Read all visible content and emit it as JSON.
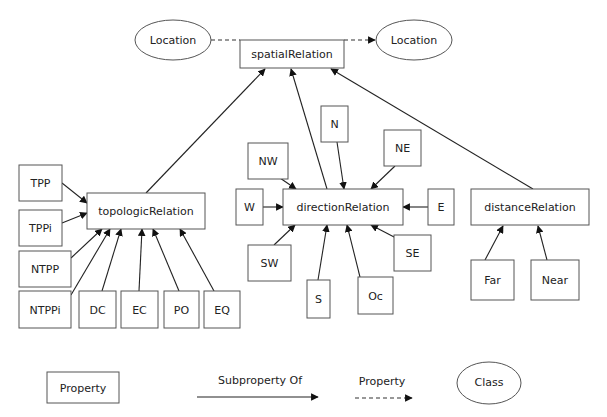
{
  "diagram": {
    "nodes": [
      {
        "id": "loc1",
        "label": "Location",
        "shape": "ellipse",
        "cx": 173,
        "cy": 40,
        "rx": 38,
        "ry": 20
      },
      {
        "id": "spatial",
        "label": "spatialRelation",
        "shape": "box",
        "x": 240,
        "y": 40,
        "w": 104,
        "h": 28
      },
      {
        "id": "loc2",
        "label": "Location",
        "shape": "ellipse",
        "cx": 414,
        "cy": 40,
        "rx": 38,
        "ry": 20
      },
      {
        "id": "topo",
        "label": "topologicRelation",
        "shape": "box",
        "x": 87,
        "y": 193,
        "w": 118,
        "h": 36
      },
      {
        "id": "TPP",
        "label": "TPP",
        "shape": "box",
        "x": 19,
        "y": 165,
        "w": 43,
        "h": 36
      },
      {
        "id": "TPPi",
        "label": "TPPi",
        "shape": "box",
        "x": 19,
        "y": 210,
        "w": 43,
        "h": 36
      },
      {
        "id": "NTPP",
        "label": "NTPP",
        "shape": "box",
        "x": 19,
        "y": 251,
        "w": 52,
        "h": 36
      },
      {
        "id": "NTPPi",
        "label": "NTPPi",
        "shape": "box",
        "x": 19,
        "y": 291,
        "w": 52,
        "h": 37
      },
      {
        "id": "DC",
        "label": "DC",
        "shape": "box",
        "x": 79,
        "y": 291,
        "w": 37,
        "h": 37
      },
      {
        "id": "EC",
        "label": "EC",
        "shape": "box",
        "x": 121,
        "y": 291,
        "w": 37,
        "h": 37
      },
      {
        "id": "PO",
        "label": "PO",
        "shape": "box",
        "x": 164,
        "y": 291,
        "w": 35,
        "h": 37
      },
      {
        "id": "EQ",
        "label": "EQ",
        "shape": "box",
        "x": 204,
        "y": 291,
        "w": 36,
        "h": 37
      },
      {
        "id": "dir",
        "label": "directionRelation",
        "shape": "box",
        "x": 283,
        "y": 189,
        "w": 120,
        "h": 36
      },
      {
        "id": "N",
        "label": "N",
        "shape": "box",
        "x": 321,
        "y": 106,
        "w": 27,
        "h": 36
      },
      {
        "id": "NE",
        "label": "NE",
        "shape": "box",
        "x": 384,
        "y": 130,
        "w": 37,
        "h": 36
      },
      {
        "id": "NW",
        "label": "NW",
        "shape": "box",
        "x": 248,
        "y": 143,
        "w": 40,
        "h": 36
      },
      {
        "id": "W",
        "label": "W",
        "shape": "box",
        "x": 236,
        "y": 189,
        "w": 27,
        "h": 36
      },
      {
        "id": "E",
        "label": "E",
        "shape": "box",
        "x": 428,
        "y": 189,
        "w": 26,
        "h": 36
      },
      {
        "id": "SW",
        "label": "SW",
        "shape": "box",
        "x": 248,
        "y": 245,
        "w": 43,
        "h": 36
      },
      {
        "id": "SE",
        "label": "SE",
        "shape": "box",
        "x": 394,
        "y": 235,
        "w": 37,
        "h": 36
      },
      {
        "id": "S",
        "label": "S",
        "shape": "box",
        "x": 307,
        "y": 280,
        "w": 23,
        "h": 38
      },
      {
        "id": "Oc",
        "label": "Oc",
        "shape": "box",
        "x": 358,
        "y": 277,
        "w": 35,
        "h": 37
      },
      {
        "id": "dist",
        "label": "distanceRelation",
        "shape": "box",
        "x": 471,
        "y": 189,
        "w": 118,
        "h": 36
      },
      {
        "id": "Far",
        "label": "Far",
        "shape": "box",
        "x": 471,
        "y": 260,
        "w": 43,
        "h": 40
      },
      {
        "id": "Near",
        "label": "Near",
        "shape": "box",
        "x": 531,
        "y": 260,
        "w": 48,
        "h": 40
      }
    ],
    "edges": [
      {
        "from": "loc1",
        "to": "spatial",
        "kind": "property",
        "x1": 211,
        "y1": 40,
        "x2": 240,
        "y2": 40,
        "arrow": false
      },
      {
        "from": "spatial",
        "to": "loc2",
        "kind": "property",
        "x1": 344,
        "y1": 40,
        "x2": 375,
        "y2": 40,
        "arrow": true
      },
      {
        "from": "topo",
        "to": "spatial",
        "kind": "subPropertyOf",
        "x1": 146,
        "y1": 193,
        "x2": 265,
        "y2": 69
      },
      {
        "from": "dir",
        "to": "spatial",
        "kind": "subPropertyOf",
        "x1": 327,
        "y1": 189,
        "x2": 291,
        "y2": 69
      },
      {
        "from": "dist",
        "to": "spatial",
        "kind": "subPropertyOf",
        "x1": 533,
        "y1": 189,
        "x2": 331,
        "y2": 69
      },
      {
        "from": "TPP",
        "to": "topo",
        "kind": "subPropertyOf",
        "x1": 62,
        "y1": 183,
        "x2": 87,
        "y2": 203
      },
      {
        "from": "TPPi",
        "to": "topo",
        "kind": "subPropertyOf",
        "x1": 62,
        "y1": 223,
        "x2": 87,
        "y2": 213
      },
      {
        "from": "NTPP",
        "to": "topo",
        "kind": "subPropertyOf",
        "x1": 71,
        "y1": 258,
        "x2": 102,
        "y2": 229
      },
      {
        "from": "NTPPi",
        "to": "topo",
        "kind": "subPropertyOf",
        "x1": 71,
        "y1": 295,
        "x2": 110,
        "y2": 229
      },
      {
        "from": "DC",
        "to": "topo",
        "kind": "subPropertyOf",
        "x1": 102,
        "y1": 291,
        "x2": 121,
        "y2": 229
      },
      {
        "from": "EC",
        "to": "topo",
        "kind": "subPropertyOf",
        "x1": 139,
        "y1": 291,
        "x2": 142,
        "y2": 229
      },
      {
        "from": "PO",
        "to": "topo",
        "kind": "subPropertyOf",
        "x1": 179,
        "y1": 291,
        "x2": 153,
        "y2": 229
      },
      {
        "from": "EQ",
        "to": "topo",
        "kind": "subPropertyOf",
        "x1": 214,
        "y1": 291,
        "x2": 180,
        "y2": 229
      },
      {
        "from": "N",
        "to": "dir",
        "kind": "subPropertyOf",
        "x1": 337,
        "y1": 142,
        "x2": 344,
        "y2": 189
      },
      {
        "from": "NE",
        "to": "dir",
        "kind": "subPropertyOf",
        "x1": 395,
        "y1": 166,
        "x2": 371,
        "y2": 189
      },
      {
        "from": "NW",
        "to": "dir",
        "kind": "subPropertyOf",
        "x1": 280,
        "y1": 178,
        "x2": 296,
        "y2": 189
      },
      {
        "from": "W",
        "to": "dir",
        "kind": "subPropertyOf",
        "x1": 263,
        "y1": 207,
        "x2": 283,
        "y2": 207
      },
      {
        "from": "E",
        "to": "dir",
        "kind": "subPropertyOf",
        "x1": 428,
        "y1": 207,
        "x2": 403,
        "y2": 207
      },
      {
        "from": "SW",
        "to": "dir",
        "kind": "subPropertyOf",
        "x1": 274,
        "y1": 245,
        "x2": 295,
        "y2": 225
      },
      {
        "from": "SE",
        "to": "dir",
        "kind": "subPropertyOf",
        "x1": 396,
        "y1": 238,
        "x2": 371,
        "y2": 225
      },
      {
        "from": "S",
        "to": "dir",
        "kind": "subPropertyOf",
        "x1": 318,
        "y1": 280,
        "x2": 327,
        "y2": 225
      },
      {
        "from": "Oc",
        "to": "dir",
        "kind": "subPropertyOf",
        "x1": 360,
        "y1": 277,
        "x2": 347,
        "y2": 225
      },
      {
        "from": "Far",
        "to": "dist",
        "kind": "subPropertyOf",
        "x1": 485,
        "y1": 260,
        "x2": 503,
        "y2": 226
      },
      {
        "from": "Near",
        "to": "dist",
        "kind": "subPropertyOf",
        "x1": 547,
        "y1": 260,
        "x2": 538,
        "y2": 226
      }
    ]
  },
  "legend": {
    "property_box_label": "Property",
    "subproperty_label": "Subproperty Of",
    "property_arrow_label": "Property",
    "class_label": "Class"
  },
  "colors": {
    "stroke": "#555555",
    "edge": "#222222",
    "text": "#222222",
    "background": "#ffffff"
  }
}
